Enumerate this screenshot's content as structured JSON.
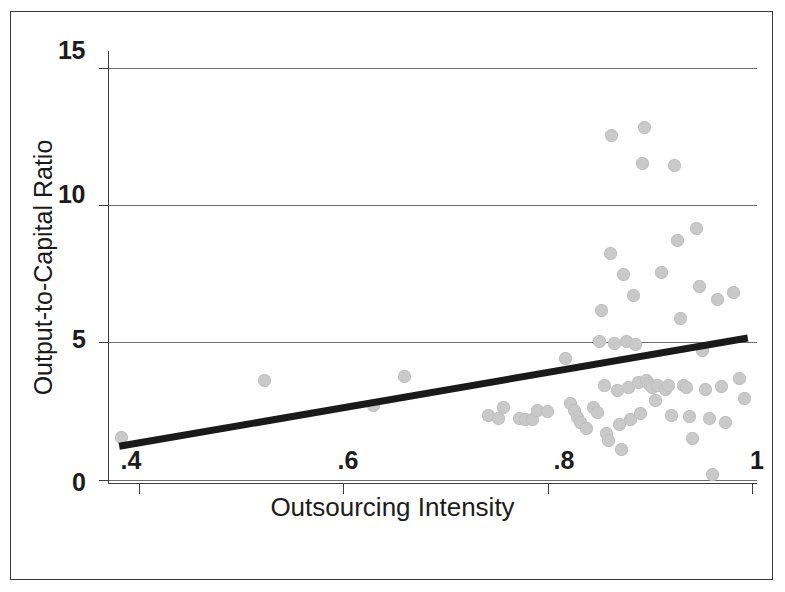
{
  "figure": {
    "background": "#ffffff",
    "frame_color": "#3a3a3a",
    "marker_color": "#c9c9c9",
    "line_color": "#1a1a1a",
    "gridline_color": "#6e6e6e"
  },
  "chart_data": {
    "type": "scatter",
    "title": "",
    "xlabel": "Outsourcing Intensity",
    "ylabel": "Output-to-Capital Ratio",
    "xlim": [
      0.37,
      1.005
    ],
    "ylim": [
      -0.15,
      15.6
    ],
    "xticks": [
      0.4,
      0.6,
      0.8,
      1
    ],
    "xtick_labels": [
      ".4",
      ".6",
      ".8",
      "1"
    ],
    "yticks": [
      0,
      5,
      10,
      15
    ],
    "ytick_labels": [
      "0",
      "5",
      "10",
      "15"
    ],
    "grid": "horizontal",
    "legend": "none",
    "series": [
      {
        "name": "Firms",
        "marker": "circle",
        "color": "#c9c9c9",
        "points": [
          [
            0.383,
            1.55
          ],
          [
            0.523,
            3.62
          ],
          [
            0.63,
            2.72
          ],
          [
            0.66,
            3.76
          ],
          [
            0.742,
            2.35
          ],
          [
            0.752,
            2.22
          ],
          [
            0.757,
            2.62
          ],
          [
            0.773,
            2.25
          ],
          [
            0.778,
            2.18
          ],
          [
            0.785,
            2.2
          ],
          [
            0.79,
            2.52
          ],
          [
            0.8,
            2.5
          ],
          [
            0.818,
            4.43
          ],
          [
            0.822,
            2.78
          ],
          [
            0.826,
            2.52
          ],
          [
            0.829,
            2.28
          ],
          [
            0.832,
            2.08
          ],
          [
            0.838,
            1.88
          ],
          [
            0.845,
            2.62
          ],
          [
            0.849,
            2.45
          ],
          [
            0.851,
            5.02
          ],
          [
            0.853,
            6.15
          ],
          [
            0.856,
            3.42
          ],
          [
            0.858,
            1.7
          ],
          [
            0.86,
            1.45
          ],
          [
            0.862,
            8.25
          ],
          [
            0.863,
            12.52
          ],
          [
            0.866,
            4.98
          ],
          [
            0.868,
            3.25
          ],
          [
            0.87,
            2.02
          ],
          [
            0.872,
            1.1
          ],
          [
            0.874,
            7.48
          ],
          [
            0.877,
            5.05
          ],
          [
            0.879,
            3.35
          ],
          [
            0.881,
            2.18
          ],
          [
            0.884,
            6.72
          ],
          [
            0.886,
            4.92
          ],
          [
            0.889,
            3.55
          ],
          [
            0.891,
            2.42
          ],
          [
            0.893,
            11.52
          ],
          [
            0.895,
            12.82
          ],
          [
            0.897,
            3.6
          ],
          [
            0.899,
            3.5
          ],
          [
            0.901,
            3.45
          ],
          [
            0.903,
            3.38
          ],
          [
            0.906,
            2.88
          ],
          [
            0.908,
            3.42
          ],
          [
            0.912,
            7.55
          ],
          [
            0.915,
            3.3
          ],
          [
            0.918,
            3.45
          ],
          [
            0.921,
            2.35
          ],
          [
            0.924,
            11.45
          ],
          [
            0.927,
            8.72
          ],
          [
            0.93,
            5.88
          ],
          [
            0.933,
            3.42
          ],
          [
            0.936,
            3.38
          ],
          [
            0.939,
            2.3
          ],
          [
            0.942,
            1.52
          ],
          [
            0.946,
            9.15
          ],
          [
            0.949,
            7.05
          ],
          [
            0.952,
            4.7
          ],
          [
            0.955,
            3.28
          ],
          [
            0.958,
            2.22
          ],
          [
            0.961,
            0.18
          ],
          [
            0.966,
            6.58
          ],
          [
            0.97,
            3.4
          ],
          [
            0.974,
            2.08
          ],
          [
            0.982,
            6.82
          ],
          [
            0.988,
            3.68
          ],
          [
            0.993,
            2.95
          ]
        ]
      }
    ],
    "fit_line": {
      "name": "Linear fit",
      "color": "#1a1a1a",
      "x_start": 0.381,
      "y_start": 1.22,
      "x_end": 0.996,
      "y_end": 5.16
    }
  }
}
